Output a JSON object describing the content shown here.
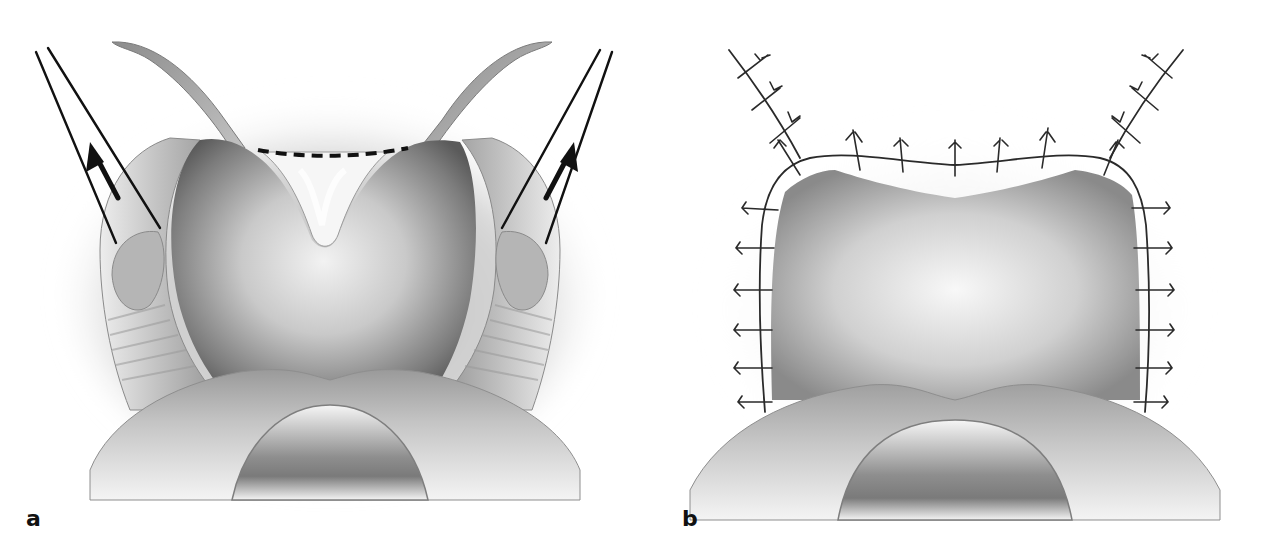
{
  "figure": {
    "type": "surgical-illustration",
    "style": "grayscale",
    "panels": [
      {
        "id": "a",
        "label": "a",
        "elements": [
          {
            "kind": "cavity",
            "shape": "heart-shaped",
            "description": "central shaded cavity with midline V notch"
          },
          {
            "kind": "incision-line",
            "style": "dashed",
            "color": "#111111",
            "segments": 7
          },
          {
            "kind": "retracted-flaps",
            "count": 2,
            "side": [
              "left",
              "right"
            ]
          },
          {
            "kind": "instrument",
            "count": 2,
            "description": "paired straight lines (forceps) on each side"
          },
          {
            "kind": "arrow",
            "count": 2,
            "direction": [
              "up-left",
              "up-right"
            ],
            "color": "#111111"
          },
          {
            "kind": "lower-lip-arch",
            "description": "curved lower structure with central U-shaped opening"
          }
        ]
      },
      {
        "id": "b",
        "label": "b",
        "elements": [
          {
            "kind": "cavity",
            "shape": "rounded-rectangle",
            "description": "closed rectangular shaded area"
          },
          {
            "kind": "suture-line",
            "style": "interrupted-stitches",
            "color": "#2a2a2a",
            "stitch_counts": {
              "top_left_arm": 3,
              "top_right_arm": 3,
              "top_edge": 6,
              "left_side": 6,
              "right_side": 6
            }
          },
          {
            "kind": "lower-lip-arch",
            "description": "curved lower structure with central U-shaped opening"
          }
        ]
      }
    ]
  },
  "colors": {
    "background": "#ffffff",
    "ink": "#111111",
    "suture": "#2a2a2a",
    "tissue_dark": "#6e6e6e",
    "tissue_mid": "#a8a8a8",
    "tissue_light": "#e2e2e2"
  }
}
